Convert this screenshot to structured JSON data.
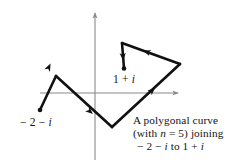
{
  "figure": {
    "background_color": "#ffffff",
    "stroke_color": "#111111",
    "axis_color": "#8a8a8a",
    "labels": {
      "start_point": "− 2 − i",
      "end_point": "1 + i"
    },
    "caption": {
      "line1": "A polygonal curve",
      "line2": "(with n  =  5) joining",
      "line3": "− 2 − i to 1 + i"
    }
  },
  "chart_data": {
    "type": "line",
    "xlabel": "Re",
    "ylabel": "Im",
    "grid": false,
    "legend": "none",
    "axes": {
      "origin_px": [
        95,
        93
      ],
      "x_axis_px": [
        40,
        93,
        181,
        93
      ],
      "y_axis_px": [
        95,
        10,
        95,
        160
      ],
      "x_arrow": "right",
      "y_arrow": "up"
    },
    "n_segments": 5,
    "start_point_label": "-2 - i",
    "end_point_label": "1 + i",
    "vertices_px": [
      [
        40,
        110
      ],
      [
        56,
        76
      ],
      [
        112,
        127
      ],
      [
        180,
        64
      ],
      [
        122,
        43
      ],
      [
        124,
        68
      ]
    ],
    "segments": [
      {
        "from": [
          40,
          110
        ],
        "to": [
          56,
          76
        ],
        "arrow_at": 0.45
      },
      {
        "from": [
          56,
          76
        ],
        "to": [
          112,
          127
        ],
        "arrow_at": 0.55
      },
      {
        "from": [
          112,
          127
        ],
        "to": [
          180,
          64
        ],
        "arrow_at": 0.52
      },
      {
        "from": [
          180,
          64
        ],
        "to": [
          122,
          43
        ],
        "arrow_at": 0.5
      },
      {
        "from": [
          122,
          43
        ],
        "to": [
          124,
          68
        ],
        "arrow_at": 0.55
      }
    ],
    "markers": [
      {
        "point_px": [
          40,
          110
        ],
        "kind": "dot",
        "label": "-2 - i"
      },
      {
        "point_px": [
          124,
          68
        ],
        "kind": "dot",
        "label": "1 + i"
      }
    ]
  }
}
